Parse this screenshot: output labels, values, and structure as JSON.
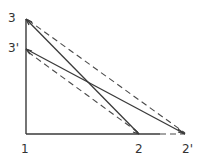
{
  "diagram": {
    "type": "hand-drawn triangle diagram",
    "points": {
      "p1": {
        "label": "1",
        "x": 26,
        "y": 134
      },
      "p2": {
        "label": "2",
        "x": 139,
        "y": 134
      },
      "p2prime": {
        "label": "2'",
        "x": 185,
        "y": 134
      },
      "p3": {
        "label": "3",
        "x": 26,
        "y": 19
      },
      "p3prime": {
        "label": "3'",
        "x": 26,
        "y": 49
      }
    },
    "labels": {
      "l1": "1",
      "l2": "2",
      "l2prime": "2'",
      "l3": "3",
      "l3prime": "3'"
    },
    "segments": {
      "solid": [
        "3-2",
        "3'-2'",
        "1-3",
        "1-2"
      ],
      "dashed": [
        "3-2'",
        "3'-2",
        "2-2'"
      ]
    }
  }
}
